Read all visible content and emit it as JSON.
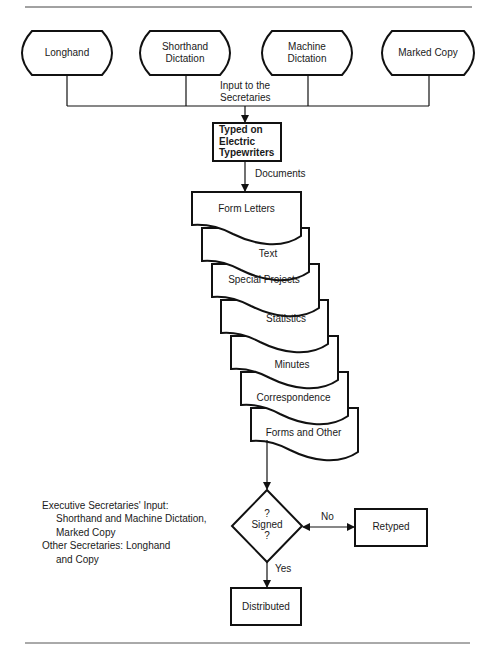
{
  "diagram": {
    "inputs": [
      {
        "label": "Longhand"
      },
      {
        "label": "Shorthand Dictation",
        "line1": "Shorthand",
        "line2": "Dictation"
      },
      {
        "label": "Machine Dictation",
        "line1": "Machine",
        "line2": "Dictation"
      },
      {
        "label": "Marked Copy"
      }
    ],
    "merge_label": {
      "line1": "Input to the",
      "line2": "Secretaries"
    },
    "process": {
      "line1": "Typed on",
      "line2": "Electric",
      "line3": "Typewriters"
    },
    "documents_label": "Documents",
    "documents": [
      "Form Letters",
      "Text",
      "Special Projects",
      "Statistics",
      "Minutes",
      "Correspondence",
      "Forms and Other"
    ],
    "decision": {
      "line1": "?",
      "line2": "Signed",
      "line3": "?"
    },
    "no_label": "No",
    "yes_label": "Yes",
    "retyped": "Retyped",
    "distributed": "Distributed",
    "notes": {
      "line1": "Executive Secretaries' Input:",
      "line2": "Shorthand and Machine Dictation,",
      "line3": "Marked Copy",
      "line4": "Other Secretaries:  Longhand",
      "line5": "and Copy"
    }
  }
}
